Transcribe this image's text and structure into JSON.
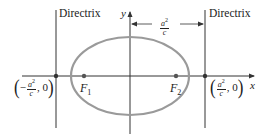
{
  "diagram": {
    "title": "",
    "type": "ellipse-with-directrices",
    "colors": {
      "ellipse_stroke": "#9a9a9a",
      "axis": "#333333",
      "directrix": "#333333",
      "point": "#555555",
      "text": "#222222"
    },
    "labels": {
      "directrix_left": "Directrix",
      "directrix_right": "Directrix",
      "x_axis": "x",
      "y_axis": "y",
      "focus1": "F",
      "focus1_sub": "1",
      "focus2": "F",
      "focus2_sub": "2",
      "distance_num": "a",
      "distance_sup": "2",
      "distance_den": "c",
      "left_point_open": "(",
      "left_point_sign": "−",
      "left_point_num": "a",
      "left_point_sup": "2",
      "left_point_den": "c",
      "left_point_rest": ", 0",
      "left_point_close": ")",
      "right_point_open": "(",
      "right_point_num": "a",
      "right_point_sup": "2",
      "right_point_den": "c",
      "right_point_rest": ", 0",
      "right_point_close": ")"
    },
    "geometry": {
      "origin": [
        130,
        76
      ],
      "ellipse_rx": 59,
      "ellipse_ry": 39,
      "focus1_x": 84,
      "focus2_x": 176,
      "directrix_left_x": 56,
      "directrix_right_x": 205
    }
  }
}
